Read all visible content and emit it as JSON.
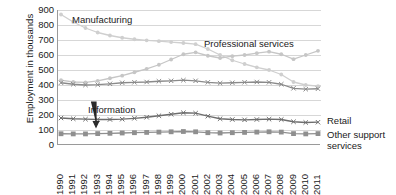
{
  "chart_data": {
    "type": "line",
    "title": "",
    "xlabel": "",
    "ylabel": "Employment in thousands",
    "ylim": [
      0,
      900
    ],
    "ytick_step": 100,
    "yticks": [
      900,
      800,
      700,
      600,
      500,
      400,
      300,
      200,
      100,
      0
    ],
    "grid": true,
    "legend_position": "right-and-inline",
    "categories": [
      1990,
      1991,
      1992,
      1993,
      1994,
      1995,
      1996,
      1997,
      1998,
      1999,
      2000,
      2001,
      2002,
      2003,
      2004,
      2005,
      2006,
      2007,
      2008,
      2009,
      2010,
      2011
    ],
    "series": [
      {
        "name": "Manufacturing",
        "color": "#cfcfcf",
        "marker": "circle",
        "label_placement": "inline",
        "values": [
          870,
          820,
          780,
          750,
          730,
          715,
          705,
          698,
          692,
          686,
          680,
          672,
          640,
          600,
          565,
          540,
          518,
          500,
          470,
          420,
          400,
          392
        ]
      },
      {
        "name": "Professional services",
        "color": "#c6c6c6",
        "marker": "circle",
        "label_placement": "inline",
        "values": [
          432,
          420,
          418,
          428,
          445,
          462,
          485,
          508,
          535,
          570,
          605,
          618,
          595,
          580,
          592,
          600,
          612,
          622,
          605,
          572,
          600,
          628
        ]
      },
      {
        "name": "Retail",
        "color": "#8a8a8a",
        "marker": "x",
        "label_placement": "right",
        "values": [
          415,
          405,
          400,
          402,
          408,
          415,
          418,
          420,
          425,
          428,
          432,
          428,
          418,
          412,
          415,
          418,
          420,
          418,
          405,
          378,
          372,
          375
        ]
      },
      {
        "name": "Information",
        "color": "#6e6e6e",
        "marker": "x",
        "label_placement": "inline-arrow",
        "values": [
          180,
          175,
          172,
          170,
          170,
          172,
          178,
          185,
          195,
          205,
          215,
          212,
          192,
          175,
          170,
          168,
          170,
          172,
          170,
          155,
          150,
          152
        ]
      },
      {
        "name": "Other support services",
        "color": "#8f8f8f",
        "marker": "square",
        "label_placement": "right",
        "values": [
          75,
          74,
          74,
          76,
          78,
          80,
          82,
          84,
          86,
          88,
          90,
          88,
          82,
          80,
          82,
          84,
          86,
          88,
          86,
          76,
          74,
          76
        ]
      }
    ],
    "annotations": [
      {
        "text": "Manufacturing",
        "series": "Manufacturing"
      },
      {
        "text": "Professional services",
        "series": "Professional services"
      },
      {
        "text": "Information",
        "series": "Information",
        "has_arrow": true
      }
    ],
    "right_labels": [
      {
        "text": "Retail",
        "series": "Retail"
      },
      {
        "text": "Other support services",
        "series": "Other support services"
      }
    ]
  },
  "axes": {
    "y_title": "Employment in thousands",
    "y_tick_labels": [
      "900",
      "800",
      "700",
      "600",
      "500",
      "400",
      "300",
      "200",
      "100",
      "0"
    ],
    "x_tick_labels": [
      "1990",
      "1991",
      "1992",
      "1993",
      "1994",
      "1995",
      "1996",
      "1997",
      "1998",
      "1999",
      "2000",
      "2001",
      "2002",
      "2003",
      "2004",
      "2005",
      "2006",
      "2007",
      "2008",
      "2009",
      "2010",
      "2011"
    ]
  },
  "annotations": {
    "manufacturing": "Manufacturing",
    "professional_services": "Professional services",
    "information": "Information"
  },
  "legend": {
    "retail": "Retail",
    "other_support_services": "Other support services"
  },
  "colors": {
    "manufacturing": "#cfcfcf",
    "professional_services": "#c6c6c6",
    "retail": "#8a8a8a",
    "information": "#6e6e6e",
    "other_support_services": "#8f8f8f",
    "grid": "#d7d7d7",
    "axis": "#9a9a9a",
    "text": "#1a1a1a"
  }
}
